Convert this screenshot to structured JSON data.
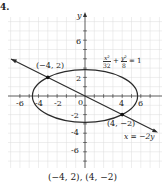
{
  "problem_number": "4.",
  "axes": {
    "x_label": "x",
    "y_label": "y"
  },
  "ticks": {
    "x": [
      "-6",
      "-4",
      "-2",
      "0",
      "4",
      "6"
    ],
    "y": [
      "6",
      "2",
      "-2",
      "-4",
      "-6"
    ]
  },
  "equations": {
    "ellipse": {
      "num1": "x²",
      "den1": "32",
      "plus": "+",
      "num2": "y²",
      "den2": "8",
      "rhs": "= 1"
    },
    "line": "x = −2y"
  },
  "points": [
    {
      "label": "(−4, 2)",
      "x": -4,
      "y": 2
    },
    {
      "label": "(4, −2)",
      "x": 4,
      "y": -2
    }
  ],
  "caption": "(−4, 2), (4, −2)",
  "colors": {
    "grid": "#d8d8d8",
    "curve": "#2a2a2a",
    "axis": "#333333"
  }
}
